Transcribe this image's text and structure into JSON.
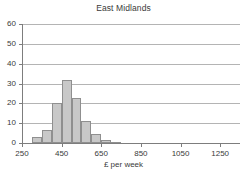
{
  "chart_data": {
    "type": "bar",
    "title": "East Midlands",
    "xlabel": "£ per week",
    "ylabel": "",
    "xlim": [
      250,
      1350
    ],
    "ylim": [
      0,
      60
    ],
    "grid": true,
    "legend": null,
    "bin_width": 50,
    "xticks": [
      250,
      450,
      650,
      850,
      1050,
      1250
    ],
    "xtick_labels": [
      "250",
      "450",
      "650",
      "850",
      "1050",
      "1250"
    ],
    "yticks": [
      0,
      10,
      20,
      30,
      40,
      50,
      60
    ],
    "ytick_labels": [
      "0",
      "10",
      "20",
      "30",
      "40",
      "50",
      "60"
    ],
    "bins": [
      {
        "x0": 300,
        "x1": 350,
        "value": 3
      },
      {
        "x0": 350,
        "x1": 400,
        "value": 6.5
      },
      {
        "x0": 400,
        "x1": 450,
        "value": 20
      },
      {
        "x0": 450,
        "x1": 500,
        "value": 32
      },
      {
        "x0": 500,
        "x1": 550,
        "value": 22.5
      },
      {
        "x0": 550,
        "x1": 600,
        "value": 11
      },
      {
        "x0": 600,
        "x1": 650,
        "value": 4.5
      },
      {
        "x0": 650,
        "x1": 700,
        "value": 1.5
      },
      {
        "x0": 700,
        "x1": 750,
        "value": 0.4
      }
    ],
    "categories": [
      "300",
      "350",
      "400",
      "450",
      "500",
      "550",
      "600",
      "650",
      "700"
    ],
    "values": [
      3,
      6.5,
      20,
      32,
      22.5,
      11,
      4.5,
      1.5,
      0.4
    ],
    "colors": {
      "bar_fill": "#c8c8c8",
      "bar_edge": "#8f8f8f",
      "grid": "#b4b4b4",
      "axis": "#7d7d7d",
      "text": "#3a3a3a",
      "background": "#ffffff"
    }
  }
}
